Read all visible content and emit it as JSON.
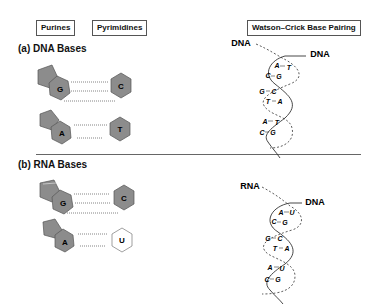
{
  "header": {
    "purines_label": "Purines",
    "pyrimidines_label": "Pyrimidines",
    "pairing_label": "Watson–Crick Base Pairing"
  },
  "sections": [
    {
      "title": "(a) DNA Bases",
      "pairs": [
        {
          "purine": "G",
          "pyrimidine": "C",
          "hbonds": 3
        },
        {
          "purine": "A",
          "pyrimidine": "T",
          "hbonds": 2
        }
      ],
      "helix": {
        "strand_left_label": "DNA",
        "strand_right_label": "DNA",
        "base_pairs": [
          {
            "left": "A",
            "right": "T"
          },
          {
            "left": "C",
            "right": "G"
          },
          {
            "left": "G",
            "right": "C"
          },
          {
            "left": "T",
            "right": "A"
          },
          {
            "left": "A",
            "right": "T"
          },
          {
            "left": "C",
            "right": "G"
          }
        ]
      }
    },
    {
      "title": "(b) RNA Bases",
      "pairs": [
        {
          "purine": "G",
          "pyrimidine": "C",
          "hbonds": 3
        },
        {
          "purine": "A",
          "pyrimidine": "U",
          "hbonds": 2
        }
      ],
      "helix": {
        "strand_left_label": "RNA",
        "strand_right_label": "DNA",
        "base_pairs": [
          {
            "left": "A",
            "right": "U"
          },
          {
            "left": "C",
            "right": "G"
          },
          {
            "left": "G",
            "right": "C"
          },
          {
            "left": "T",
            "right": "A"
          },
          {
            "left": "A",
            "right": "U"
          },
          {
            "left": "C",
            "right": "G"
          }
        ]
      }
    }
  ],
  "colors": {
    "base_fill": "#8c8c8c",
    "base_stroke": "#555555",
    "uracil_fill": "#ffffff",
    "line": "#333333"
  }
}
